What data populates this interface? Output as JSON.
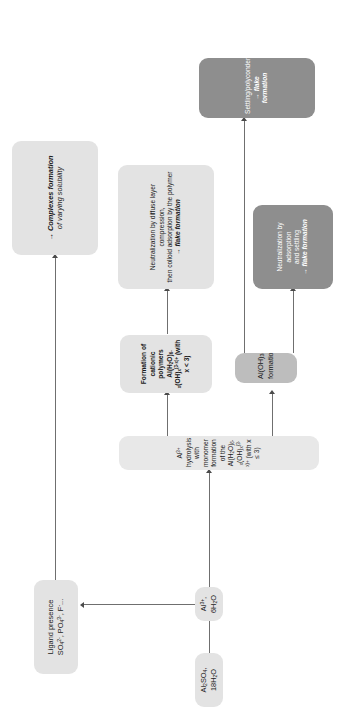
{
  "diagram": {
    "orientation_deg": -90,
    "colors": {
      "node_light": "#e3e3e3",
      "node_light_alt": "#e8e8e8",
      "node_mid": "#bdbdbd",
      "node_dark": "#8e8e8e",
      "connector": "#6f6f6f",
      "arrowhead": "#4a4a4a",
      "text": "#1b1b1b",
      "background": "#ffffff"
    },
    "nodes": {
      "alum": {
        "label": "Al2SO4, 18H2O",
        "formula_parts": [
          "Al",
          "2",
          "SO",
          "4",
          ", 18H",
          "2",
          "O"
        ]
      },
      "al_ion": {
        "label": "Al3+, 6H2O"
      },
      "ligand": {
        "line1": "Ligand presence",
        "line2": "SO42-, PO43-, F-..."
      },
      "complexes": {
        "line1": "→ Complexes formation",
        "line2": "of varying solubility"
      },
      "hydrolysis": {
        "label": "Al3+ hydrolysis with monomer formation of the Al(H2O)6-x(OH)x(3-x)+ (with x ≤ 3)"
      },
      "cationic_polymers": {
        "line1": "Formation of cationic polymers",
        "line2": "Al(H2O)6-x(OH)x(3-x)+ (with x < 3)"
      },
      "neutralization_diffuse": {
        "line1": "Neutralization by diffuse layer compression,",
        "line2": "then colloid adsorption by the polymer",
        "line3": "→ flake formation"
      },
      "aloh3": {
        "label": "Al(OH)3(s) formation"
      },
      "neutralization_adsorption": {
        "line1": "Neutralization by adsorption",
        "line2": "and settling",
        "line3": "→ flake formation"
      },
      "settling": {
        "line1": "Settling/polycondensation",
        "line2": "→ flake formation"
      }
    },
    "edges": [
      {
        "name": "alum-to-al-ion",
        "from": "alum",
        "to": "al_ion"
      },
      {
        "name": "al-ion-to-hydrolysis",
        "from": "al_ion",
        "to": "hydrolysis"
      },
      {
        "name": "al-ion-to-ligand",
        "from": "al_ion",
        "to": "ligand"
      },
      {
        "name": "ligand-to-complexes",
        "from": "ligand",
        "to": "complexes"
      },
      {
        "name": "hydrolysis-to-cationic-polymers",
        "from": "hydrolysis",
        "to": "cationic_polymers"
      },
      {
        "name": "cationic-polymers-to-neutralization-diffuse",
        "from": "cationic_polymers",
        "to": "neutralization_diffuse"
      },
      {
        "name": "hydrolysis-to-aloh3",
        "from": "hydrolysis",
        "to": "aloh3"
      },
      {
        "name": "aloh3-to-neutralization-adsorption",
        "from": "aloh3",
        "to": "neutralization_adsorption"
      },
      {
        "name": "aloh3-to-settling",
        "from": "aloh3",
        "to": "settling"
      }
    ]
  }
}
